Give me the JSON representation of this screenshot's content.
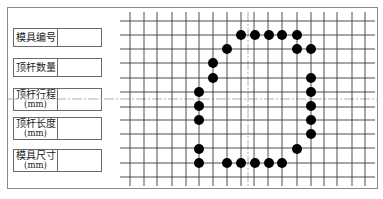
{
  "fields": [
    {
      "label": "模具编号",
      "unit": "",
      "value": ""
    },
    {
      "label": "顶杆数量",
      "unit": "",
      "value": ""
    },
    {
      "label": "顶杆行程",
      "unit": "(mm)",
      "value": ""
    },
    {
      "label": "顶杆长度",
      "unit": "(mm)",
      "value": ""
    },
    {
      "label": "模具尺寸",
      "unit": "(mm)",
      "value": ""
    }
  ],
  "grid": {
    "vertical_lines_x": [
      130,
      144,
      157,
      172,
      186,
      199,
      213,
      227,
      241,
      254,
      268,
      282,
      297,
      311,
      324,
      337,
      352,
      365
    ],
    "horizontal_lines_y": [
      21,
      35,
      49,
      63,
      78,
      92,
      107,
      120,
      134,
      148,
      163,
      177
    ],
    "center_vertical_x": 248,
    "center_horizontal_y": 99,
    "line_color": "#3a3a3a",
    "center_line_color": "#b0b0b0"
  },
  "ejector_pins": [
    [
      241,
      35
    ],
    [
      255,
      35
    ],
    [
      269,
      35
    ],
    [
      282,
      35
    ],
    [
      297,
      35
    ],
    [
      227,
      49
    ],
    [
      297,
      49
    ],
    [
      311,
      49
    ],
    [
      213,
      63
    ],
    [
      213,
      78
    ],
    [
      311,
      78
    ],
    [
      199,
      92
    ],
    [
      311,
      92
    ],
    [
      199,
      106
    ],
    [
      311,
      106
    ],
    [
      199,
      120
    ],
    [
      311,
      120
    ],
    [
      311,
      134
    ],
    [
      199,
      149
    ],
    [
      297,
      149
    ],
    [
      199,
      163
    ],
    [
      227,
      163
    ],
    [
      241,
      163
    ],
    [
      255,
      163
    ],
    [
      269,
      163
    ],
    [
      282,
      163
    ]
  ],
  "pin_color": "#000000"
}
